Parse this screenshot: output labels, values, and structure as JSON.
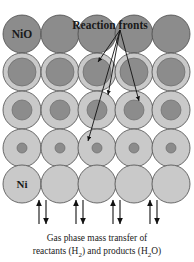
{
  "figure": {
    "title_labels": {
      "top_left_label": "NiO",
      "reaction_fronts_label": "Reaction fronts",
      "bottom_left_label": "Ni"
    },
    "caption": {
      "line1": "Gas phase mass transfer of",
      "line2_pre": "reactants (H",
      "line2_sub1": "2",
      "line2_mid": ") and products (H",
      "line2_sub2": "2",
      "line2_post": "O)"
    },
    "colors": {
      "shell_light_gray": "#c9c9c9",
      "core_dark_gray": "#8c8c8c",
      "outline": "#4a4a4a",
      "arrow": "#111111",
      "background": "#ffffff",
      "text": "#1a1a1a"
    },
    "geometry": {
      "columns": 5,
      "rows": 5,
      "particle_diameter_px": 38,
      "col_centers_x": [
        22,
        60,
        97,
        134,
        171
      ],
      "row_centers_y": [
        34,
        72,
        110,
        148,
        184
      ]
    },
    "rows": [
      {
        "index": 1,
        "phase": "NiO",
        "core_radius_px": 19,
        "description": "fully unreacted nickel oxide particle"
      },
      {
        "index": 2,
        "phase": "NiO core with Ni shell",
        "core_radius_px": 14,
        "description": "reaction front near particle surface"
      },
      {
        "index": 3,
        "phase": "NiO core with Ni shell",
        "core_radius_px": 10,
        "description": "reaction front advanced inward"
      },
      {
        "index": 4,
        "phase": "NiO core with Ni shell",
        "core_radius_px": 5,
        "description": "reaction front nearly consumed core"
      },
      {
        "index": 5,
        "phase": "Ni",
        "core_radius_px": 0,
        "description": "fully reduced metallic nickel particle"
      }
    ],
    "reaction_front_arrows": [
      {
        "name": "arrow-to-row2-col3",
        "from_x": 120,
        "from_y": 30,
        "to_x": 98,
        "to_y": 62
      },
      {
        "name": "arrow-to-row3-col3",
        "from_x": 120,
        "from_y": 30,
        "to_x": 108,
        "to_y": 95
      },
      {
        "name": "arrow-to-row3-col4",
        "from_x": 120,
        "from_y": 30,
        "to_x": 138,
        "to_y": 100
      },
      {
        "name": "arrow-to-row4-col3",
        "from_x": 120,
        "from_y": 30,
        "to_x": 88,
        "to_y": 140
      }
    ],
    "gas_transfer_arrows": {
      "count": 4,
      "x_positions": [
        42,
        79,
        116,
        153
      ],
      "up_arrow_top_y": 199,
      "up_arrow_bottom_y": 224,
      "down_arrow_top_y": 199,
      "down_arrow_bottom_y": 224,
      "pair_offset_px": 5
    }
  }
}
